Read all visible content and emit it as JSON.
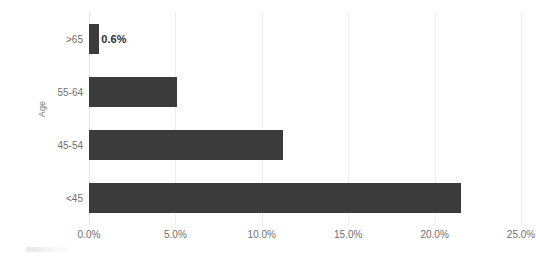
{
  "chart_data": {
    "type": "bar",
    "orientation": "horizontal",
    "title": "",
    "xlabel": "",
    "ylabel": "Age",
    "categories": [
      ">65",
      "55-64",
      "45-54",
      "<45"
    ],
    "values": [
      0.6,
      5.1,
      11.2,
      21.5
    ],
    "value_unit": "%",
    "data_labels": [
      "0.6%",
      "",
      "",
      ""
    ],
    "xlim": [
      0,
      25
    ],
    "xticks": [
      0,
      5,
      10,
      15,
      20,
      25
    ],
    "xtick_labels": [
      "0.0%",
      "5.0%",
      "10.0%",
      "15.0%",
      "20.0%",
      "25.0%"
    ],
    "grid": "vertical",
    "legend": "none",
    "bar_color": "#3b3b3b",
    "gridline_color": "#ededed",
    "tick_label_color": "#6f6f6f"
  },
  "axes": {
    "y_title": "Age"
  }
}
